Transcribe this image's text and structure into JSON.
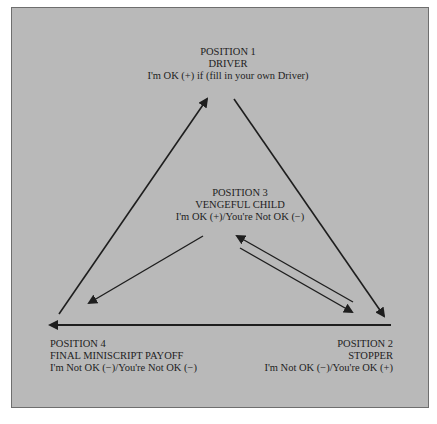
{
  "diagram": {
    "type": "triangle-cycle",
    "background_color": "#b9b9b9",
    "line_color": "#1e1e1e",
    "positions": [
      {
        "id": "position-1",
        "title": "POSITION 1",
        "name": "DRIVER",
        "statement": "I'm OK (+) if  (fill in your own Driver)"
      },
      {
        "id": "position-2",
        "title": "POSITION 2",
        "name": "STOPPER",
        "statement": "I'm Not OK (−)/You're OK (+)"
      },
      {
        "id": "position-3",
        "title": "POSITION 3",
        "name": "VENGEFUL CHILD",
        "statement": "I'm OK (+)/You're Not OK (−)"
      },
      {
        "id": "position-4",
        "title": "POSITION 4",
        "name": "FINAL MINISCRIPT PAYOFF",
        "statement": "I'm Not OK (−)/You're Not OK (−)"
      }
    ],
    "arrows": [
      {
        "from": "position-4",
        "to": "position-1",
        "direction": "up-right"
      },
      {
        "from": "position-1",
        "to": "position-2",
        "direction": "down-right"
      },
      {
        "from": "position-2",
        "to": "position-4",
        "direction": "left"
      },
      {
        "from": "position-3",
        "to": "position-4",
        "direction": "down-left"
      },
      {
        "from": "position-3",
        "to": "position-2",
        "direction": "down-right"
      },
      {
        "from": "position-2",
        "to": "position-3",
        "direction": "up-left"
      }
    ]
  }
}
